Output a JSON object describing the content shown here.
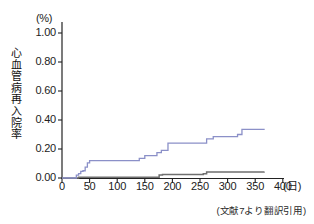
{
  "figure": {
    "unit_label": "(%)",
    "y_axis_title_chars": [
      "心",
      "血",
      "管",
      "病",
      "再",
      "入",
      "院",
      "率"
    ],
    "x_unit_label": "(日)",
    "source_note": "(文献7より翻訳引用)",
    "colors": {
      "series_primary": "#8b90c8",
      "series_secondary": "#6f6f6f",
      "axis": "#222222",
      "background": "#ffffff"
    }
  },
  "chart_data": {
    "type": "line",
    "title": "",
    "subtitle": "",
    "xlabel": "(日)",
    "ylabel": "心血管病再入院率",
    "yunit": "(%)",
    "xlim": [
      0,
      400
    ],
    "ylim": [
      0.0,
      1.0
    ],
    "xticks": [
      0,
      50,
      100,
      150,
      200,
      250,
      300,
      350,
      400
    ],
    "xtick_labels": [
      "0",
      "50",
      "100",
      "150",
      "200",
      "250",
      "300",
      "350",
      "400"
    ],
    "yticks": [
      0.0,
      0.2,
      0.4,
      0.6,
      0.8,
      1.0
    ],
    "ytick_labels": [
      "0.00",
      "0.20",
      "0.40",
      "0.60",
      "0.80",
      "1.00"
    ],
    "grid": false,
    "legend": "none",
    "step_mode": "post",
    "annotation": "(文献7より翻訳引用)",
    "series": [
      {
        "name": "series-upper",
        "color": "#8b90c8",
        "x": [
          0,
          22,
          26,
          30,
          34,
          38,
          42,
          46,
          50,
          132,
          140,
          150,
          172,
          180,
          192,
          256,
          262,
          274,
          318,
          326,
          366
        ],
        "values": [
          0.0,
          0.0,
          0.02,
          0.03,
          0.045,
          0.05,
          0.075,
          0.105,
          0.12,
          0.12,
          0.135,
          0.155,
          0.175,
          0.19,
          0.24,
          0.24,
          0.27,
          0.285,
          0.3,
          0.335,
          0.34
        ]
      },
      {
        "name": "series-lower",
        "color": "#6f6f6f",
        "x": [
          0,
          30,
          132,
          176,
          182,
          256,
          262,
          366
        ],
        "values": [
          0.0,
          0.005,
          0.005,
          0.02,
          0.025,
          0.03,
          0.042,
          0.045
        ]
      }
    ]
  }
}
